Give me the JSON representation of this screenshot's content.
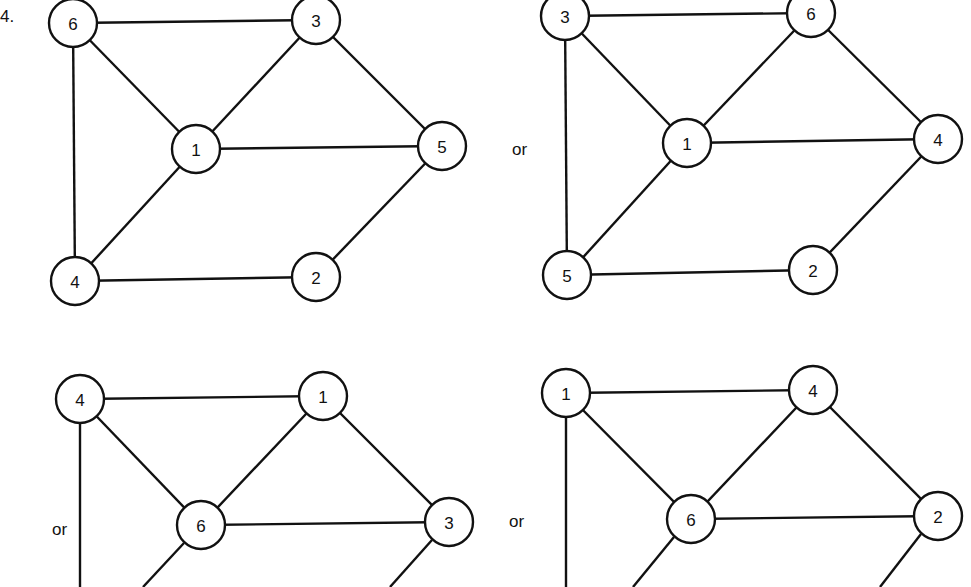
{
  "problem_number": "4.",
  "separator_label": "or",
  "node_radius": 24,
  "graphs": [
    {
      "id": "graph-1",
      "nodes": [
        {
          "label": "6",
          "x": 73,
          "y": 23
        },
        {
          "label": "3",
          "x": 316,
          "y": 20
        },
        {
          "label": "1",
          "x": 196,
          "y": 149
        },
        {
          "label": "5",
          "x": 442,
          "y": 146
        },
        {
          "label": "4",
          "x": 75,
          "y": 281
        },
        {
          "label": "2",
          "x": 316,
          "y": 277
        }
      ],
      "edges": [
        [
          "6",
          "3"
        ],
        [
          "6",
          "1"
        ],
        [
          "6",
          "4"
        ],
        [
          "3",
          "1"
        ],
        [
          "3",
          "5"
        ],
        [
          "1",
          "5"
        ],
        [
          "1",
          "4"
        ],
        [
          "4",
          "2"
        ],
        [
          "2",
          "5"
        ]
      ]
    },
    {
      "id": "graph-2",
      "or_position": {
        "x": 512,
        "y": 155
      },
      "nodes": [
        {
          "label": "3",
          "x": 565,
          "y": 16
        },
        {
          "label": "6",
          "x": 811,
          "y": 13
        },
        {
          "label": "1",
          "x": 687,
          "y": 143
        },
        {
          "label": "4",
          "x": 938,
          "y": 139
        },
        {
          "label": "5",
          "x": 567,
          "y": 275
        },
        {
          "label": "2",
          "x": 813,
          "y": 270
        }
      ],
      "edges": [
        [
          "3",
          "6"
        ],
        [
          "3",
          "1"
        ],
        [
          "3",
          "5"
        ],
        [
          "6",
          "1"
        ],
        [
          "6",
          "4"
        ],
        [
          "1",
          "4"
        ],
        [
          "1",
          "5"
        ],
        [
          "5",
          "2"
        ],
        [
          "2",
          "4"
        ]
      ]
    },
    {
      "id": "graph-3",
      "or_position": {
        "x": 52,
        "y": 535
      },
      "nodes": [
        {
          "label": "4",
          "x": 80,
          "y": 399
        },
        {
          "label": "1",
          "x": 323,
          "y": 396
        },
        {
          "label": "6",
          "x": 201,
          "y": 525
        },
        {
          "label": "3",
          "x": 449,
          "y": 522
        }
      ],
      "edges": [
        [
          "4",
          "1"
        ],
        [
          "4",
          "6"
        ],
        [
          "1",
          "6"
        ],
        [
          "1",
          "3"
        ],
        [
          "6",
          "3"
        ]
      ],
      "cut_edges": [
        {
          "x1": 80,
          "y1": 423,
          "x2": 80,
          "y2": 587
        },
        {
          "x1": 184,
          "y1": 543,
          "x2": 143,
          "y2": 587
        },
        {
          "x1": 432,
          "y1": 540,
          "x2": 390,
          "y2": 587
        }
      ]
    },
    {
      "id": "graph-4",
      "or_position": {
        "x": 509,
        "y": 527
      },
      "nodes": [
        {
          "label": "1",
          "x": 566,
          "y": 393
        },
        {
          "label": "4",
          "x": 813,
          "y": 390
        },
        {
          "label": "6",
          "x": 691,
          "y": 519
        },
        {
          "label": "2",
          "x": 938,
          "y": 516
        }
      ],
      "edges": [
        [
          "1",
          "4"
        ],
        [
          "1",
          "6"
        ],
        [
          "4",
          "6"
        ],
        [
          "4",
          "2"
        ],
        [
          "6",
          "2"
        ]
      ],
      "cut_edges": [
        {
          "x1": 566,
          "y1": 417,
          "x2": 566,
          "y2": 587
        },
        {
          "x1": 674,
          "y1": 537,
          "x2": 633,
          "y2": 587
        },
        {
          "x1": 921,
          "y1": 534,
          "x2": 880,
          "y2": 587
        }
      ]
    }
  ]
}
